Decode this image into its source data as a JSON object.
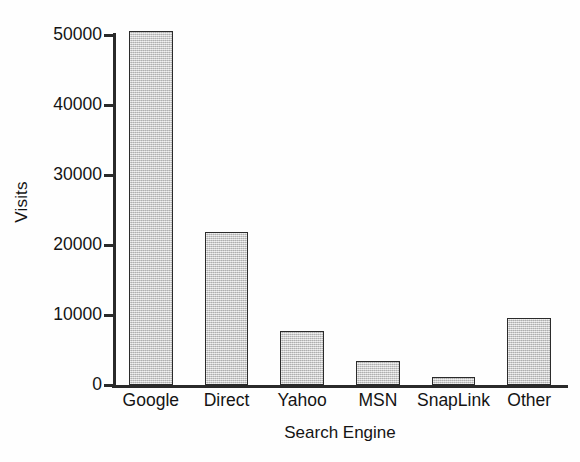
{
  "chart_data": {
    "type": "bar",
    "title": "",
    "subtitle": "",
    "xlabel": "Search Engine",
    "ylabel": "Visits",
    "categories": [
      "Google",
      "Direct",
      "Yahoo",
      "MSN",
      "SnapLink",
      "Other"
    ],
    "values": [
      50600,
      21900,
      7700,
      3500,
      1100,
      9600
    ],
    "series": [
      {
        "name": "Visits",
        "values": [
          50600,
          21900,
          7700,
          3500,
          1100,
          9600
        ]
      }
    ],
    "ylim": [
      0,
      52000
    ],
    "yticks": [
      0,
      10000,
      20000,
      30000,
      40000,
      50000
    ],
    "ytick_labels": [
      "0",
      "10000",
      "20000",
      "30000",
      "40000",
      "50000"
    ],
    "grid": false,
    "legend": false,
    "legend_position": "none",
    "bar_fill_color": "#c9c9c9",
    "bar_edge_color": "#2b2b2b",
    "axis_color": "#2a2a2a",
    "background_color": "#ffffff"
  }
}
